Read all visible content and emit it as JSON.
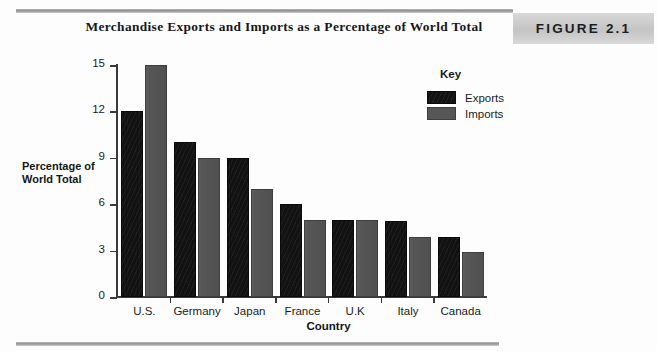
{
  "header": {
    "title": "Merchandise Exports and Imports as a Percentage of World Total",
    "figure_badge": "FIGURE 2.1"
  },
  "legend": {
    "title": "Key",
    "entries": [
      {
        "label": "Exports",
        "color": "#121212"
      },
      {
        "label": "Imports",
        "color": "#565656"
      }
    ]
  },
  "axis": {
    "y_title_line1": "Percentage of",
    "y_title_line2": "World Total",
    "x_title": "Country",
    "y_ticks": [
      "0",
      "3",
      "6",
      "9",
      "12",
      "15"
    ]
  },
  "chart_data": {
    "type": "bar",
    "title": "Merchandise Exports and Imports as a Percentage of World Total",
    "xlabel": "Country",
    "ylabel": "Percentage of World Total",
    "categories": [
      "U.S.",
      "Germany",
      "Japan",
      "France",
      "U.K",
      "Italy",
      "Canada"
    ],
    "series": [
      {
        "name": "Exports",
        "color": "#121212",
        "values": [
          12.0,
          10.0,
          9.0,
          6.0,
          5.0,
          4.9,
          3.9
        ]
      },
      {
        "name": "Imports",
        "color": "#565656",
        "values": [
          15.0,
          9.0,
          7.0,
          5.0,
          5.0,
          3.9,
          2.9
        ]
      }
    ],
    "ylim": [
      0,
      15
    ],
    "yticks": [
      0,
      3,
      6,
      9,
      12,
      15
    ],
    "grid": false,
    "legend_position": "inside-top-right"
  }
}
